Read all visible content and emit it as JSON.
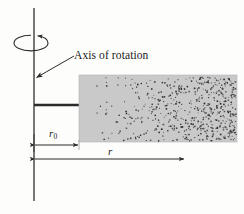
{
  "figure": {
    "type": "physics-diagram",
    "background_color": "#fdfdfc",
    "ink_color": "#2b2b2b"
  },
  "labels": {
    "axis_of_rotation": "Axis of rotation",
    "r0_symbol": "r",
    "r0_subscript": "0",
    "r_symbol": "r"
  },
  "geometry": {
    "axis": {
      "x": 34,
      "y_top": 8,
      "y_bottom": 201
    },
    "rotation_ellipse": {
      "cx": 31,
      "cy": 43,
      "rx": 17,
      "ry": 8
    },
    "leader_line": {
      "x1": 74,
      "y1": 56,
      "x2": 35,
      "y2": 78
    },
    "connector": {
      "x1": 34,
      "y1": 105,
      "x2": 79,
      "y2": 105
    },
    "slab": {
      "x": 79,
      "y": 75,
      "width": 158,
      "height": 67
    },
    "r0_dimension": {
      "x1": 34,
      "x2": 79,
      "y": 145
    },
    "r_dimension": {
      "x1": 34,
      "x2": 185,
      "y": 159
    }
  },
  "slab_style": {
    "fill_color": "#c9c9c9",
    "particle_color": "#3a3a3a",
    "density": "increases with radius"
  },
  "chart_data": {
    "type": "scatter",
    "xlabel": "r",
    "ylabel": "",
    "annotations": [
      "Axis of rotation",
      "r0",
      "r"
    ]
  }
}
